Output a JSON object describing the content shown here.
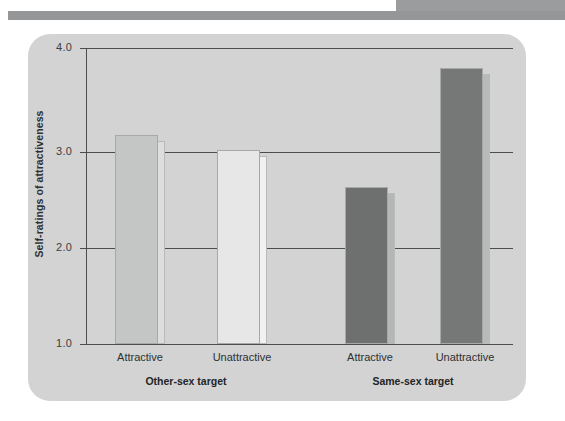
{
  "figure": {
    "panel_color": "#d2d3d2",
    "top_block_color": "#9a9c9e",
    "top_rule_color": "#949698"
  },
  "chart_data": {
    "type": "bar",
    "title": "",
    "xlabel": "",
    "ylabel": "Self-ratings of attractiveness",
    "ylim": [
      1.0,
      4.0
    ],
    "ytick_labels": [
      "4.0",
      "3.0",
      "2.0",
      "1.0"
    ],
    "ytick_values": [
      4.0,
      3.0,
      2.0,
      1.0
    ],
    "grid": true,
    "legend": "none",
    "groups": [
      {
        "name": "Other-sex target",
        "categories": [
          "Attractive",
          "Unattractive"
        ]
      },
      {
        "name": "Same-sex target",
        "categories": [
          "Attractive",
          "Unattractive"
        ]
      }
    ],
    "categories": [
      "Attractive",
      "Unattractive",
      "Attractive",
      "Unattractive"
    ],
    "values": [
      3.12,
      2.97,
      2.59,
      3.8
    ],
    "bars": [
      {
        "group": "Other-sex target",
        "category": "Attractive",
        "value": 3.12,
        "face_color": "#c4c5c5",
        "side_color": "#dcdddc"
      },
      {
        "group": "Other-sex target",
        "category": "Unattractive",
        "value": 2.97,
        "face_color": "#e6e7e6",
        "side_color": "#f0f1f0"
      },
      {
        "group": "Same-sex target",
        "category": "Attractive",
        "value": 2.59,
        "face_color": "#6e6f6f",
        "side_color": "#b5b6b6"
      },
      {
        "group": "Same-sex target",
        "category": "Unattractive",
        "value": 3.8,
        "face_color": "#767777",
        "side_color": "#b8b9b9"
      }
    ]
  }
}
